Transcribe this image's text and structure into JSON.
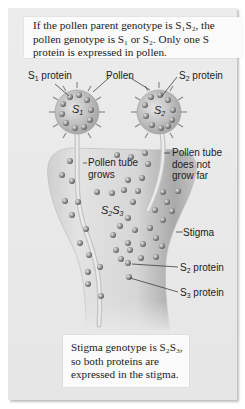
{
  "top_caption": {
    "line1": "If the pollen parent genotype is S₁S₂, the",
    "line2": "pollen genotype is S₁ or S₂. Only one S",
    "line3": "protein is expressed in pollen."
  },
  "bottom_caption": {
    "line1": "Stigma genotype is S₂S₃,",
    "line2": "so both proteins are",
    "line3": "expressed in the stigma."
  },
  "labels": {
    "s1_protein": {
      "base": "S",
      "sub": "1",
      "rest": " protein"
    },
    "pollen": "Pollen",
    "s2_protein_top": {
      "base": "S",
      "sub": "2",
      "rest": " protein"
    },
    "pollen_tube_grows_1": "Pollen tube",
    "pollen_tube_grows_2": "grows",
    "tube_not_far_1": "Pollen tube",
    "tube_not_far_2": "does not",
    "tube_not_far_3": "grow far",
    "stigma": "Stigma",
    "s2_protein": {
      "base": "S",
      "sub": "2",
      "rest": " protein"
    },
    "s3_protein": {
      "base": "S",
      "sub": "3",
      "rest": " protein"
    }
  },
  "genotypes": {
    "pollen_left": {
      "base": "S",
      "sub": "1"
    },
    "pollen_right": {
      "base": "S",
      "sub": "2"
    },
    "stigma": {
      "a": "S",
      "a_sub": "2",
      "b": "S",
      "b_sub": "3"
    }
  },
  "colors": {
    "panel": "#e8e8e8",
    "caption_bg": "#fbfbfb",
    "stigma_body": "#d4d4d4",
    "protein_bead": "#8f8f8f"
  }
}
